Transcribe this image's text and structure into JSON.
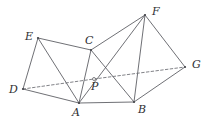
{
  "figure": {
    "kind": "geometry-diagram",
    "width": 208,
    "height": 123,
    "background_color": "#ffffff",
    "line_color": "#55565c",
    "dashed_line_color": "#6a6b71",
    "label_color": "#2e2f33",
    "vertices": [
      {
        "id": "E",
        "label": "E",
        "x": 38,
        "y": 38,
        "label_x": 25,
        "label_y": 31,
        "marker": "dot"
      },
      {
        "id": "D",
        "label": "D",
        "x": 23,
        "y": 89,
        "label_x": 9,
        "label_y": 84,
        "marker": "dot"
      },
      {
        "id": "A",
        "label": "A",
        "x": 79,
        "y": 103,
        "label_x": 72,
        "label_y": 107,
        "marker": "dot"
      },
      {
        "id": "C",
        "label": "C",
        "x": 91,
        "y": 50,
        "label_x": 85,
        "label_y": 35,
        "marker": "dot"
      },
      {
        "id": "P",
        "label": "P",
        "x": 94,
        "y": 79,
        "label_x": 91,
        "label_y": 81,
        "marker": "ring"
      },
      {
        "id": "B",
        "label": "B",
        "x": 134,
        "y": 102,
        "label_x": 138,
        "label_y": 104,
        "marker": "dot"
      },
      {
        "id": "F",
        "label": "F",
        "x": 145,
        "y": 15,
        "label_x": 152,
        "label_y": 6,
        "marker": "dot"
      },
      {
        "id": "G",
        "label": "G",
        "x": 185,
        "y": 67,
        "label_x": 192,
        "label_y": 59,
        "marker": "dot"
      }
    ],
    "solid_edges": [
      {
        "from": "E",
        "to": "C"
      },
      {
        "from": "E",
        "to": "D"
      },
      {
        "from": "E",
        "to": "A"
      },
      {
        "from": "D",
        "to": "A"
      },
      {
        "from": "C",
        "to": "A"
      },
      {
        "from": "C",
        "to": "B"
      },
      {
        "from": "C",
        "to": "F"
      },
      {
        "from": "A",
        "to": "B"
      },
      {
        "from": "A",
        "to": "F"
      },
      {
        "from": "B",
        "to": "F"
      },
      {
        "from": "B",
        "to": "G"
      },
      {
        "from": "F",
        "to": "G"
      }
    ],
    "dashed_edges": [
      {
        "from": "D",
        "to": "P"
      },
      {
        "from": "P",
        "to": "G"
      }
    ]
  }
}
